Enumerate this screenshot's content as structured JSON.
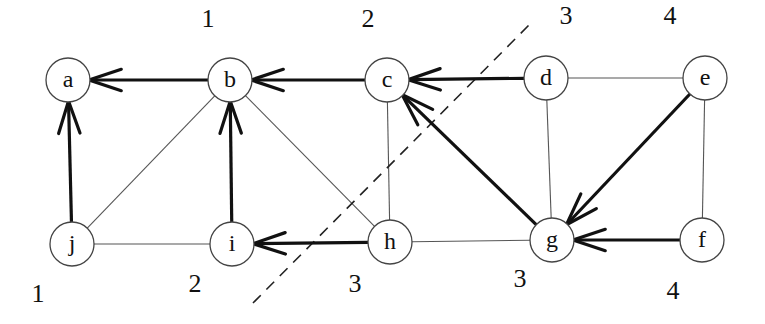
{
  "diagram": {
    "type": "graph",
    "directed_tree_edges": true,
    "nodes": [
      {
        "id": "a",
        "label": "a",
        "x": 68,
        "y": 80,
        "distance": null
      },
      {
        "id": "b",
        "label": "b",
        "x": 230,
        "y": 80,
        "distance": "1"
      },
      {
        "id": "c",
        "label": "c",
        "x": 387,
        "y": 80,
        "distance": "2"
      },
      {
        "id": "d",
        "label": "d",
        "x": 546,
        "y": 78,
        "distance": "3"
      },
      {
        "id": "e",
        "label": "e",
        "x": 705,
        "y": 78,
        "distance": "4"
      },
      {
        "id": "j",
        "label": "j",
        "x": 72,
        "y": 244,
        "distance": "1"
      },
      {
        "id": "i",
        "label": "i",
        "x": 232,
        "y": 244,
        "distance": "2"
      },
      {
        "id": "h",
        "label": "h",
        "x": 390,
        "y": 242,
        "distance": "3"
      },
      {
        "id": "g",
        "label": "g",
        "x": 552,
        "y": 240,
        "distance": "3"
      },
      {
        "id": "f",
        "label": "f",
        "x": 702,
        "y": 240,
        "distance": "4"
      }
    ],
    "distance_labels": [
      {
        "node": "b",
        "text": "1",
        "x": 208,
        "y": 18
      },
      {
        "node": "c",
        "text": "2",
        "x": 368,
        "y": 18
      },
      {
        "node": "d",
        "text": "3",
        "x": 566,
        "y": 15
      },
      {
        "node": "e",
        "text": "4",
        "x": 670,
        "y": 15
      },
      {
        "node": "j",
        "text": "1",
        "x": 38,
        "y": 293
      },
      {
        "node": "i",
        "text": "2",
        "x": 195,
        "y": 283
      },
      {
        "node": "h",
        "text": "3",
        "x": 355,
        "y": 283
      },
      {
        "node": "g",
        "text": "3",
        "x": 520,
        "y": 278
      },
      {
        "node": "f",
        "text": "4",
        "x": 673,
        "y": 290
      }
    ],
    "tree_edges": [
      {
        "from": "b",
        "to": "a"
      },
      {
        "from": "c",
        "to": "b"
      },
      {
        "from": "d",
        "to": "c"
      },
      {
        "from": "j",
        "to": "a"
      },
      {
        "from": "i",
        "to": "b"
      },
      {
        "from": "h",
        "to": "i"
      },
      {
        "from": "g",
        "to": "c"
      },
      {
        "from": "e",
        "to": "g"
      },
      {
        "from": "f",
        "to": "g"
      }
    ],
    "other_edges": [
      {
        "from": "b",
        "to": "j"
      },
      {
        "from": "b",
        "to": "h"
      },
      {
        "from": "j",
        "to": "i"
      },
      {
        "from": "c",
        "to": "h"
      },
      {
        "from": "h",
        "to": "g"
      },
      {
        "from": "d",
        "to": "g"
      },
      {
        "from": "d",
        "to": "e"
      },
      {
        "from": "e",
        "to": "f"
      }
    ],
    "cut_line": {
      "x1": 253,
      "y1": 303,
      "x2": 532,
      "y2": 22,
      "style": "dashed"
    }
  }
}
